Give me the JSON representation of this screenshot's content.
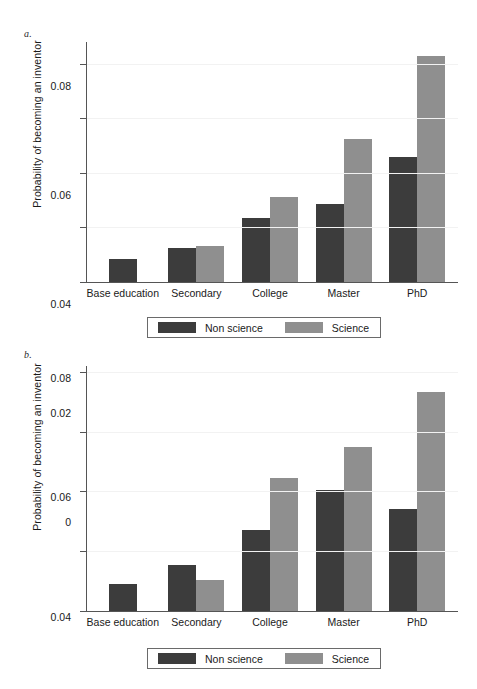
{
  "figure": {
    "panels": [
      {
        "letter": "a.",
        "ylabel": "Probability of becoming an inventor",
        "legend": {
          "nonscience": "Non science",
          "science": "Science"
        }
      },
      {
        "letter": "b.",
        "ylabel": "Probability of becoming an inventor",
        "legend": {
          "nonscience": "Non science",
          "science": "Science"
        }
      }
    ],
    "colors": {
      "nonscience": "#3c3c3c",
      "science": "#8f8f8f",
      "axis": "#555555",
      "grid": "#f2f2f2"
    }
  },
  "chart_data": [
    {
      "type": "bar",
      "title": "a.",
      "xlabel": "",
      "ylabel": "Probability of becoming an inventor",
      "categories": [
        "Base education",
        "Secondary",
        "College",
        "Master",
        "PhD"
      ],
      "series": [
        {
          "name": "Non science",
          "color": "#3c3c3c",
          "values": [
            0.0085,
            0.0123,
            0.0235,
            0.0285,
            0.046
          ]
        },
        {
          "name": "Science",
          "color": "#8f8f8f",
          "values": [
            null,
            0.0131,
            0.0313,
            0.0525,
            0.083
          ]
        }
      ],
      "ylim": [
        0,
        0.088
      ],
      "yticks": [
        0,
        0.02,
        0.04,
        0.06,
        0.08
      ],
      "ytick_labels": [
        "0",
        "0.02",
        "0.04",
        "0.06",
        "0.08"
      ],
      "grid": true,
      "legend_position": "below"
    },
    {
      "type": "bar",
      "title": "b.",
      "xlabel": "",
      "ylabel": "Probability of becoming an inventor",
      "categories": [
        "Base education",
        "Secondary",
        "College",
        "Master",
        "PhD"
      ],
      "series": [
        {
          "name": "Non science",
          "color": "#3c3c3c",
          "values": [
            0.009,
            0.0155,
            0.027,
            0.0405,
            0.0343
          ]
        },
        {
          "name": "Science",
          "color": "#8f8f8f",
          "values": [
            null,
            0.0105,
            0.0445,
            0.055,
            0.0733
          ]
        }
      ],
      "ylim": [
        0,
        0.082
      ],
      "yticks": [
        0,
        0.02,
        0.04,
        0.06,
        0.08
      ],
      "ytick_labels": [
        "0",
        "0.02",
        "0.04",
        "0.06",
        "0.08"
      ],
      "grid": true,
      "legend_position": "below"
    }
  ]
}
